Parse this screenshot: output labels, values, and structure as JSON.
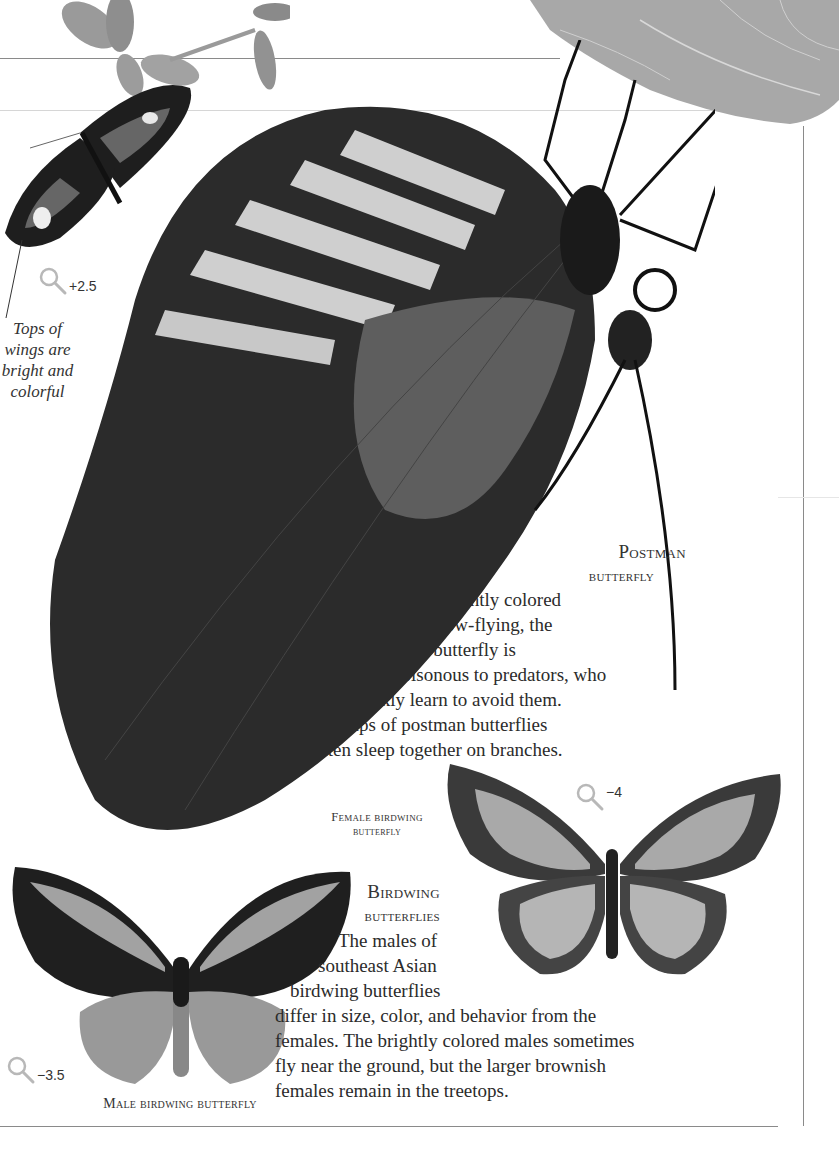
{
  "page": {
    "background": "#ffffff",
    "rule_color": "#8a8a8a"
  },
  "images": {
    "leaf": {
      "label": "leaf"
    },
    "flower": {
      "label": "flower stem"
    },
    "small_postman": {
      "label": "small postman butterfly (top view)"
    },
    "postman": {
      "label": "postman butterfly (side view, hanging)"
    },
    "female_birdwing": {
      "label": "female birdwing butterfly"
    },
    "male_birdwing": {
      "label": "male birdwing butterfly"
    }
  },
  "annotations": {
    "wings_note": [
      "Tops of",
      "wings are",
      "bright and",
      "colorful"
    ]
  },
  "scale_badges": {
    "small_postman": {
      "icon": "magnifier-icon",
      "value": "+2.5"
    },
    "female_birdwing": {
      "icon": "magnifier-icon",
      "value": "−4"
    },
    "male_birdwing": {
      "icon": "magnifier-icon",
      "value": "−3.5"
    }
  },
  "postman_section": {
    "heading_line1": "Postman",
    "heading_line2": "butterfly",
    "body_lines": [
      "Brightly colored",
      "and slow-flying, the",
      "postman butterfly is",
      "poisonous to predators, who",
      "quickly learn to avoid them.",
      "Groups of postman butterflies",
      "often sleep together on branches."
    ]
  },
  "birdwing_section": {
    "heading_line1": "Birdwing",
    "heading_line2": "butterflies",
    "body_lines": [
      "The males of",
      "southeast Asian",
      "birdwing butterflies",
      "differ in size, color, and behavior from the",
      "females. The brightly colored males sometimes",
      "fly near the ground, but the larger brownish",
      "females remain in the treetops."
    ]
  },
  "captions": {
    "female_line1": "Female birdwing",
    "female_line2": "butterfly",
    "male": "Male birdwing butterfly"
  }
}
